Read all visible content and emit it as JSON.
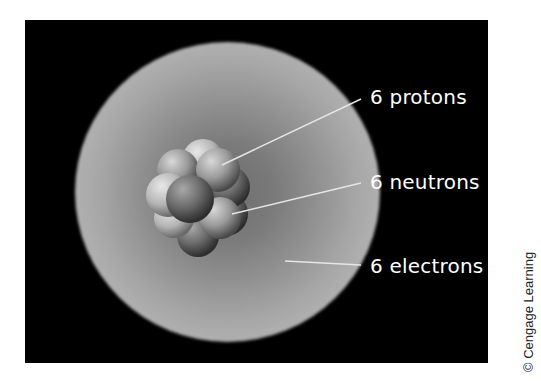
{
  "figure": {
    "labels": {
      "protons": "6 protons",
      "neutrons": "6 neutrons",
      "electrons": "6 electrons"
    },
    "credit": "© Cengage Learning"
  },
  "colors": {
    "background": "#000000",
    "label_text": "#ffffff",
    "leader_line": "#e6e6e6",
    "credit_text": "#222222"
  }
}
